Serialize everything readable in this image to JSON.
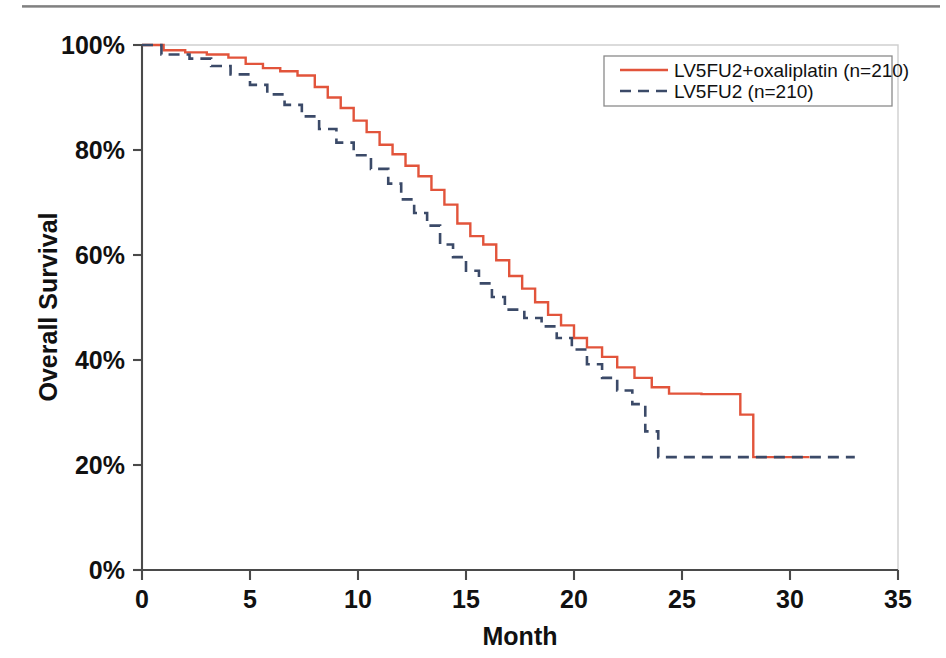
{
  "figure": {
    "background_color": "#ffffff",
    "width": 946,
    "height": 658
  },
  "chart_data": {
    "type": "line",
    "title": "",
    "subtitle": "",
    "xlabel": "Month",
    "ylabel": "Overall Survival",
    "xlim": [
      0,
      35
    ],
    "ylim": [
      0,
      100
    ],
    "xticks": [
      0,
      5,
      10,
      15,
      20,
      25,
      30,
      35
    ],
    "xtick_labels": [
      "0",
      "5",
      "10",
      "15",
      "20",
      "25",
      "30",
      "35"
    ],
    "yticks": [
      0,
      20,
      40,
      60,
      80,
      100
    ],
    "ytick_labels": [
      "0%",
      "20%",
      "40%",
      "60%",
      "80%",
      "100%"
    ],
    "grid": false,
    "legend_position": "top-right",
    "curve_style": "kaplan-meier-step",
    "series": [
      {
        "name": "LV5FU2+oxaliplatin (n=210)",
        "label": "LV5FU2+oxaliplatin (n=210)",
        "n": 210,
        "color": "#E2543B",
        "linestyle": "solid",
        "points": [
          [
            0.0,
            100.0
          ],
          [
            0.6,
            100.0
          ],
          [
            1.0,
            99.0
          ],
          [
            1.6,
            99.0
          ],
          [
            2.0,
            98.6
          ],
          [
            2.6,
            98.6
          ],
          [
            3.0,
            98.2
          ],
          [
            3.6,
            98.2
          ],
          [
            4.0,
            97.6
          ],
          [
            4.4,
            97.6
          ],
          [
            4.8,
            96.4
          ],
          [
            5.2,
            96.4
          ],
          [
            5.6,
            95.6
          ],
          [
            6.0,
            95.6
          ],
          [
            6.4,
            95.0
          ],
          [
            6.8,
            95.0
          ],
          [
            7.2,
            94.2
          ],
          [
            7.6,
            94.2
          ],
          [
            8.0,
            92.0
          ],
          [
            8.3,
            92.0
          ],
          [
            8.6,
            90.0
          ],
          [
            8.9,
            90.0
          ],
          [
            9.2,
            88.0
          ],
          [
            9.5,
            88.0
          ],
          [
            9.8,
            85.6
          ],
          [
            10.1,
            85.6
          ],
          [
            10.4,
            83.4
          ],
          [
            10.7,
            83.4
          ],
          [
            11.0,
            81.0
          ],
          [
            11.3,
            81.0
          ],
          [
            11.6,
            79.2
          ],
          [
            11.9,
            79.2
          ],
          [
            12.2,
            77.0
          ],
          [
            12.5,
            77.0
          ],
          [
            12.8,
            75.0
          ],
          [
            13.1,
            75.0
          ],
          [
            13.4,
            72.4
          ],
          [
            13.7,
            72.4
          ],
          [
            14.0,
            69.6
          ],
          [
            14.3,
            69.6
          ],
          [
            14.6,
            66.0
          ],
          [
            14.9,
            66.0
          ],
          [
            15.2,
            63.6
          ],
          [
            15.5,
            63.6
          ],
          [
            15.8,
            62.0
          ],
          [
            16.1,
            62.0
          ],
          [
            16.4,
            59.0
          ],
          [
            16.7,
            59.0
          ],
          [
            17.0,
            56.0
          ],
          [
            17.3,
            56.0
          ],
          [
            17.6,
            53.6
          ],
          [
            17.9,
            53.6
          ],
          [
            18.2,
            51.0
          ],
          [
            18.5,
            51.0
          ],
          [
            18.8,
            48.6
          ],
          [
            19.1,
            48.6
          ],
          [
            19.4,
            46.6
          ],
          [
            19.7,
            46.6
          ],
          [
            20.0,
            44.2
          ],
          [
            20.3,
            44.2
          ],
          [
            20.6,
            42.4
          ],
          [
            21.0,
            42.4
          ],
          [
            21.3,
            40.6
          ],
          [
            21.7,
            40.6
          ],
          [
            22.0,
            38.6
          ],
          [
            22.4,
            38.6
          ],
          [
            22.8,
            36.6
          ],
          [
            23.2,
            36.6
          ],
          [
            23.6,
            34.8
          ],
          [
            24.0,
            34.8
          ],
          [
            24.4,
            33.6
          ],
          [
            25.6,
            33.6
          ],
          [
            25.9,
            33.5
          ],
          [
            27.4,
            33.5
          ],
          [
            27.7,
            29.6
          ],
          [
            28.0,
            29.6
          ],
          [
            28.3,
            21.5
          ],
          [
            30.9,
            21.5
          ]
        ]
      },
      {
        "name": "LV5FU2 (n=210)",
        "label": "LV5FU2 (n=210)",
        "n": 210,
        "color": "#3B4A68",
        "linestyle": "dashed",
        "points": [
          [
            0.0,
            100.0
          ],
          [
            0.5,
            100.0
          ],
          [
            0.9,
            98.2
          ],
          [
            1.8,
            98.2
          ],
          [
            2.2,
            97.4
          ],
          [
            2.8,
            97.4
          ],
          [
            3.2,
            96.0
          ],
          [
            3.7,
            96.0
          ],
          [
            4.1,
            94.4
          ],
          [
            4.6,
            94.4
          ],
          [
            5.0,
            92.4
          ],
          [
            5.4,
            92.4
          ],
          [
            5.8,
            90.6
          ],
          [
            6.2,
            90.6
          ],
          [
            6.6,
            88.6
          ],
          [
            7.0,
            88.6
          ],
          [
            7.4,
            86.4
          ],
          [
            7.8,
            86.4
          ],
          [
            8.2,
            84.0
          ],
          [
            8.6,
            84.0
          ],
          [
            9.0,
            81.4
          ],
          [
            9.4,
            81.4
          ],
          [
            9.8,
            79.0
          ],
          [
            10.2,
            79.0
          ],
          [
            10.6,
            76.4
          ],
          [
            11.0,
            76.4
          ],
          [
            11.4,
            73.6
          ],
          [
            11.7,
            73.6
          ],
          [
            12.0,
            70.6
          ],
          [
            12.3,
            70.6
          ],
          [
            12.6,
            68.0
          ],
          [
            12.9,
            68.0
          ],
          [
            13.2,
            65.6
          ],
          [
            13.5,
            65.6
          ],
          [
            13.8,
            62.0
          ],
          [
            14.1,
            62.0
          ],
          [
            14.4,
            59.6
          ],
          [
            14.7,
            59.6
          ],
          [
            15.0,
            57.0
          ],
          [
            15.3,
            57.0
          ],
          [
            15.6,
            54.6
          ],
          [
            15.9,
            54.6
          ],
          [
            16.2,
            52.0
          ],
          [
            16.5,
            52.0
          ],
          [
            16.8,
            49.6
          ],
          [
            17.4,
            49.6
          ],
          [
            17.7,
            48.0
          ],
          [
            18.2,
            48.0
          ],
          [
            18.5,
            46.4
          ],
          [
            18.9,
            46.4
          ],
          [
            19.2,
            44.2
          ],
          [
            19.6,
            44.2
          ],
          [
            19.9,
            42.0
          ],
          [
            20.3,
            42.0
          ],
          [
            20.6,
            39.2
          ],
          [
            21.0,
            39.2
          ],
          [
            21.3,
            36.6
          ],
          [
            21.7,
            36.6
          ],
          [
            22.0,
            34.2
          ],
          [
            22.4,
            34.2
          ],
          [
            22.7,
            31.6
          ],
          [
            23.0,
            31.6
          ],
          [
            23.3,
            26.4
          ],
          [
            23.6,
            26.4
          ],
          [
            23.9,
            21.5
          ],
          [
            33.0,
            21.5
          ]
        ]
      }
    ],
    "annotations": []
  },
  "legend": {
    "entries": [
      {
        "label": "LV5FU2+oxaliplatin (n=210)",
        "color": "#E2543B",
        "style": "solid"
      },
      {
        "label": "LV5FU2 (n=210)",
        "color": "#3B4A68",
        "style": "dashed"
      }
    ]
  },
  "axes": {
    "x_title": "Month",
    "y_title": "Overall Survival"
  },
  "colors": {
    "series_red": "#E2543B",
    "series_blue": "#3B4A68",
    "axis": "#4a4a4a",
    "frame": "#cfcfcf",
    "text": "#111111"
  }
}
